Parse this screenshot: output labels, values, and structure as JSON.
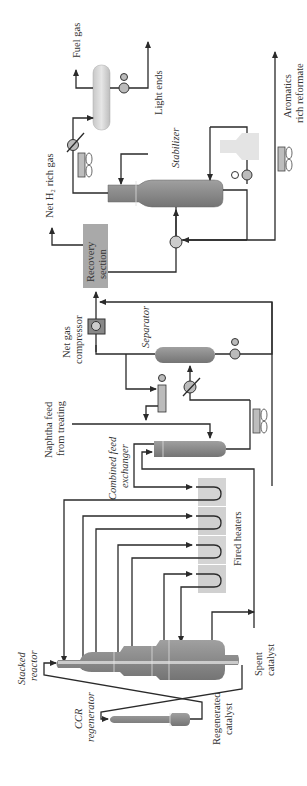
{
  "diagram": {
    "colors": {
      "line": "#2a2a2a",
      "vessel_dark": "#7d7d7d",
      "vessel_light": "#b5b5b5",
      "heater_box": "#d0d0d0",
      "recovery_box": "#a9a9a9",
      "valve_fill": "#b8b8b8"
    },
    "labels": {
      "fuel_gas": "Fuel gas",
      "light_ends": "Light ends",
      "net_h2_rich_gas": "Net H₂ rich gas",
      "stabilizer": "Stabilizer",
      "aromatics_line1": "Aromatics",
      "aromatics_line2": "rich reformate",
      "recovery_line1": "Recovery",
      "recovery_line2": "section",
      "net_gas_line1": "Net gas",
      "net_gas_line2": "compressor",
      "separator": "Separator",
      "naphtha_line1": "Naphtha feed",
      "naphtha_line2": "from treating",
      "combined_line1": "Combined feed",
      "combined_line2": "exchanger",
      "fired_heaters": "Fired heaters",
      "stacked_line1": "Stacked",
      "stacked_line2": "reactor",
      "ccr_line1": "CCR",
      "ccr_line2": "regenerator",
      "regen_line1": "Regenerated",
      "regen_line2": "catalyst",
      "spent_line1": "Spent",
      "spent_line2": "catalyst"
    }
  }
}
